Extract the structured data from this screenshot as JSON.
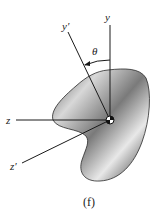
{
  "figure": {
    "caption": "(f)",
    "axes": {
      "y": "y",
      "y_prime": "y′",
      "z": "z",
      "z_prime": "z′"
    },
    "angle_label": "θ",
    "colors": {
      "line": "#1a1a1a",
      "shape_dark": "#3a3a3a",
      "shape_light": "#f2f2f2",
      "background": "#ffffff"
    }
  }
}
